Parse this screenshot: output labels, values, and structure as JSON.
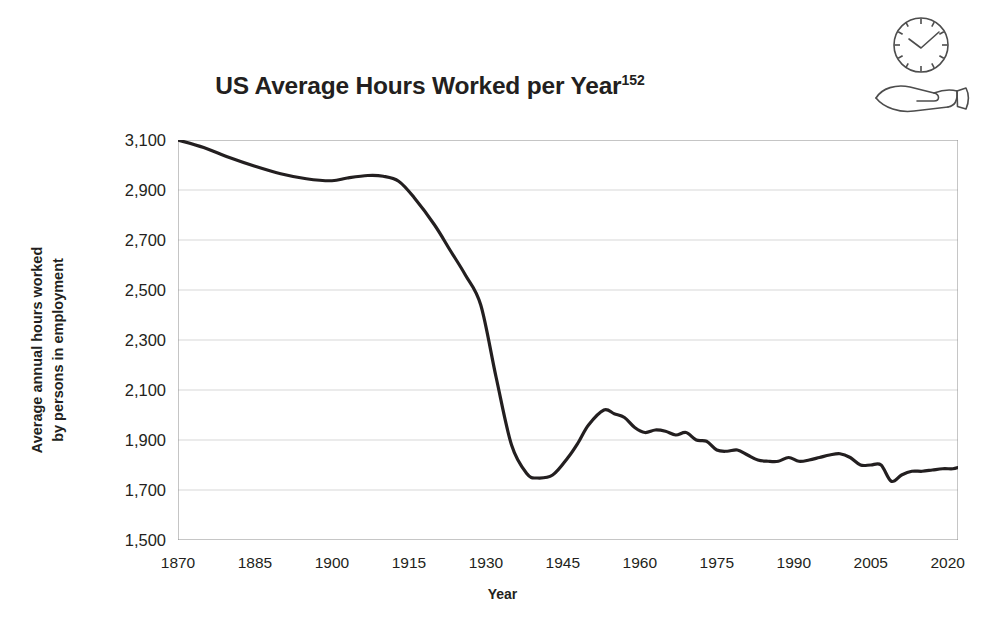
{
  "title": {
    "text": "US Average Hours Worked per Year",
    "superscript": "152"
  },
  "axis": {
    "x_label": "Year",
    "y_label_line1": "Average annual hours worked",
    "y_label_line2": "by persons in employment"
  },
  "icon": {
    "name": "clock-over-hand-icon"
  },
  "colors": {
    "line": "#231f20",
    "grid": "#d7d7d7",
    "axis": "#8c8c8c",
    "text": "#231f20",
    "background": "#ffffff"
  },
  "chart_data": {
    "type": "line",
    "title": "US Average Hours Worked per Year",
    "xlabel": "Year",
    "ylabel": "Average annual hours worked by persons in employment",
    "xlim": [
      1870,
      2022
    ],
    "ylim": [
      1500,
      3100
    ],
    "xticks": [
      1870,
      1885,
      1900,
      1915,
      1930,
      1945,
      1960,
      1975,
      1990,
      2005,
      2020
    ],
    "xtick_labels": [
      "1870",
      "1885",
      "1900",
      "1915",
      "1930",
      "1945",
      "1960",
      "1975",
      "1990",
      "2005",
      "2020"
    ],
    "yticks": [
      1500,
      1700,
      1900,
      2100,
      2300,
      2500,
      2700,
      2900,
      3100
    ],
    "ytick_labels": [
      "1,500",
      "1,700",
      "1,900",
      "2,100",
      "2,300",
      "2,500",
      "2,700",
      "2,900",
      "3,100"
    ],
    "x_minor_tick_step": 5,
    "grid": "horizontal",
    "legend": "none",
    "series": [
      {
        "name": "US average annual hours worked per worker",
        "x": [
          1870,
          1875,
          1880,
          1885,
          1890,
          1895,
          1900,
          1903,
          1907,
          1910,
          1913,
          1916,
          1920,
          1923,
          1926,
          1929,
          1932,
          1935,
          1938,
          1940,
          1943,
          1946,
          1948,
          1950,
          1953,
          1955,
          1957,
          1959,
          1961,
          1963,
          1965,
          1967,
          1969,
          1971,
          1973,
          1975,
          1977,
          1979,
          1981,
          1983,
          1985,
          1987,
          1989,
          1991,
          1993,
          1995,
          1997,
          1999,
          2001,
          2003,
          2005,
          2007,
          2009,
          2011,
          2013,
          2015,
          2017,
          2019,
          2021,
          2022
        ],
        "y": [
          3100,
          3070,
          3030,
          2995,
          2965,
          2945,
          2937,
          2948,
          2958,
          2955,
          2935,
          2870,
          2760,
          2660,
          2560,
          2440,
          2150,
          1880,
          1765,
          1748,
          1760,
          1830,
          1890,
          1960,
          2020,
          2005,
          1990,
          1950,
          1930,
          1940,
          1935,
          1920,
          1930,
          1900,
          1895,
          1860,
          1855,
          1860,
          1840,
          1820,
          1815,
          1815,
          1830,
          1815,
          1820,
          1830,
          1840,
          1845,
          1830,
          1800,
          1800,
          1800,
          1735,
          1760,
          1775,
          1775,
          1780,
          1785,
          1785,
          1790
        ]
      }
    ]
  }
}
